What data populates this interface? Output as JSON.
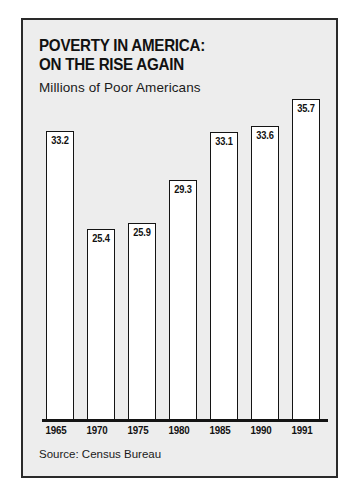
{
  "panel": {
    "title_lines": [
      "POVERTY IN AMERICA:",
      "ON THE RISE AGAIN"
    ],
    "subtitle": "Millions of Poor Americans",
    "source": "Source: Census Bureau",
    "colors": {
      "panel_background": "#ededed",
      "panel_border": "#2a2a2a",
      "bar_fill": "#ffffff",
      "bar_outline": "#141414",
      "text": "#111111",
      "page_background": "#ffffff"
    }
  },
  "chart_data": {
    "type": "bar",
    "title": "POVERTY IN AMERICA: ON THE RISE AGAIN",
    "subtitle": "Millions of Poor Americans",
    "xlabel": "",
    "ylabel": "Millions of Poor Americans",
    "categories": [
      "1965",
      "1970",
      "1975",
      "1980",
      "1985",
      "1990",
      "1991"
    ],
    "values": [
      33.2,
      25.4,
      25.9,
      29.3,
      33.1,
      33.6,
      35.7
    ],
    "value_labels": [
      "33.2",
      "25.4",
      "25.9",
      "29.3",
      "33.1",
      "33.6",
      "35.7"
    ],
    "ylim": [
      10.3,
      36.6
    ],
    "grid": false,
    "legend": null,
    "source": "Source: Census Bureau"
  }
}
